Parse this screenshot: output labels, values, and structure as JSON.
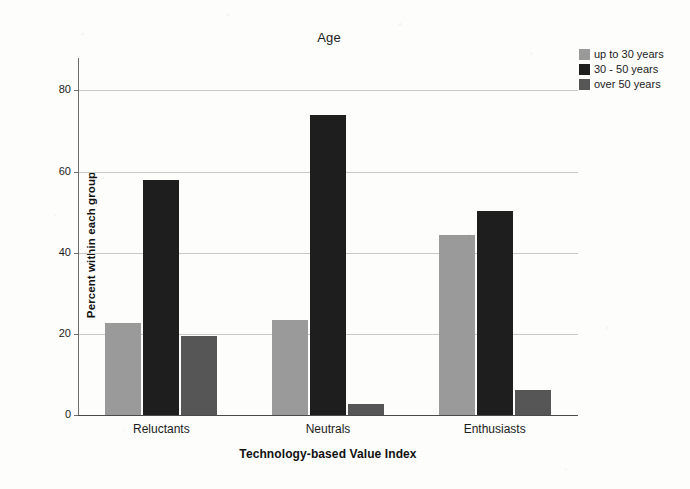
{
  "chart_data": {
    "type": "bar",
    "title": "Age",
    "xlabel": "Technology-based Value Index",
    "ylabel": "Percent within each group",
    "categories": [
      "Reluctants",
      "Neutrals",
      "Enthusiasts"
    ],
    "series": [
      {
        "name": "up to 30 years",
        "color": "#9a9a9a",
        "values": [
          22.8,
          23.3,
          44.3
        ]
      },
      {
        "name": "30 - 50 years",
        "color": "#1e1e1e",
        "values": [
          58.0,
          74.0,
          50.3
        ]
      },
      {
        "name": "over 50 years",
        "color": "#565656",
        "values": [
          19.5,
          2.8,
          6.2
        ]
      }
    ],
    "ylim": [
      0,
      88
    ],
    "yticks": [
      0,
      20,
      40,
      60,
      80
    ],
    "ytick_labels": [
      "0",
      "20",
      "40",
      "60",
      "80"
    ],
    "grid": true,
    "legend_position": "top-right"
  },
  "legend": {
    "items": [
      {
        "label": "up to 30 years",
        "color": "#9a9a9a"
      },
      {
        "label": "30 - 50 years",
        "color": "#1e1e1e"
      },
      {
        "label": "over 50 years",
        "color": "#565656"
      }
    ]
  },
  "colors": {
    "background": "#fdfdfc",
    "axis": "#4a4a4a",
    "gridline": "#c9c9c9",
    "text": "#1b1b1b"
  }
}
